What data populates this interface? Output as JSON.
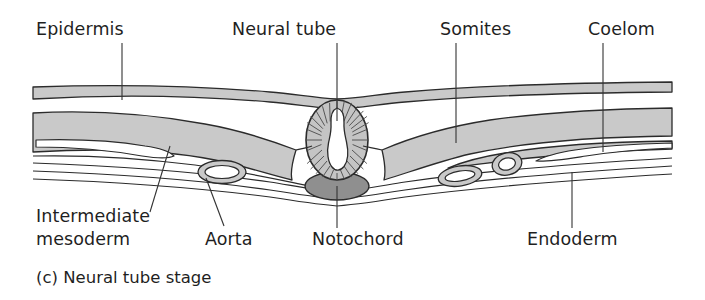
{
  "figure": {
    "caption": "(c) Neural tube stage",
    "type": "cross-section-embryo-diagram"
  },
  "colors": {
    "background": "#ffffff",
    "tissue_fill": "#c9c9c9",
    "notochord_fill": "#8f8f8f",
    "neural_tube_fill": "#c4c4c4",
    "outline": "#2b2b2b",
    "text": "#1f1f1f",
    "leader_line": "#333333",
    "lumen_fill": "#ffffff"
  },
  "labels_top": [
    {
      "id": "epidermis",
      "text": "Epidermis",
      "x": 36,
      "y": 35,
      "leader_x": 122,
      "leader_y1": 43,
      "leader_y2": 100
    },
    {
      "id": "neural-tube",
      "text": "Neural tube",
      "x": 232,
      "y": 35,
      "leader_x": 337,
      "leader_y1": 43,
      "leader_y2": 120
    },
    {
      "id": "somites",
      "text": "Somites",
      "x": 440,
      "y": 35,
      "leader_x": 456,
      "leader_y1": 43,
      "leader_y2": 143
    },
    {
      "id": "coelom",
      "text": "Coelom",
      "x": 588,
      "y": 35,
      "leader_x": 603,
      "leader_y1": 43,
      "leader_y2": 145
    }
  ],
  "labels_bottom": [
    {
      "id": "intermediate-mesoderm",
      "text_line1": "Intermediate",
      "text_line2": "mesoderm",
      "x": 36,
      "y1": 222,
      "y2": 245
    },
    {
      "id": "aorta",
      "text": "Aorta",
      "x": 205,
      "y": 245
    },
    {
      "id": "notochord",
      "text": "Notochord",
      "x": 312,
      "y": 245
    },
    {
      "id": "endoderm",
      "text": "Endoderm",
      "x": 527,
      "y": 245
    }
  ],
  "structures": {
    "epidermis": "outer ectoderm band across the top",
    "neural_tube": "central oval with radial neuroepithelial cells and teardrop lumen",
    "notochord": "dark gray ellipse beneath neural tube",
    "somites": "paired mesoderm blocks flanking the neural tube",
    "coelom": "white cavity splitting lateral plate mesoderm",
    "aorta": "small vessel ring lateral-ventral to notochord",
    "endoderm": "thin double line layer at the base"
  },
  "neural_tube_geometry": {
    "center_x": 337,
    "center_y": 140,
    "radius_x": 31,
    "radius_y": 40,
    "radial_line_count": 26
  },
  "notochord_geometry": {
    "center_x": 337,
    "center_y": 186,
    "radius_x": 32,
    "radius_y": 14
  }
}
